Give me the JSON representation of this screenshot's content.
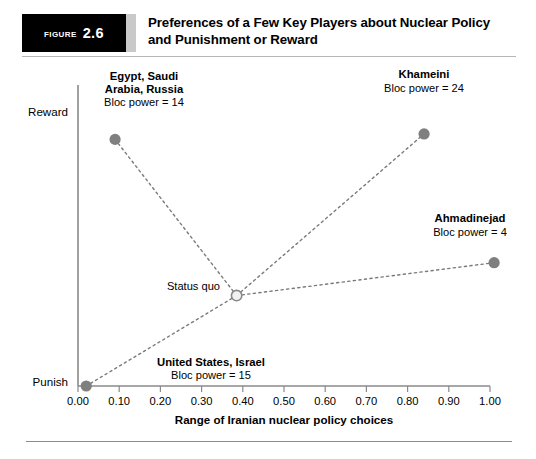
{
  "figure": {
    "tag_word": "Figure",
    "tag_number": "2.6",
    "title_line1": "Preferences of a Few Key Players about Nuclear Policy",
    "title_line2": "and Punishment or Reward"
  },
  "chart_data": {
    "type": "scatter",
    "title": "Preferences of a Few Key Players about Nuclear Policy and Punishment or Reward",
    "xlabel": "Range of Iranian nuclear policy choices",
    "ylabel": "",
    "xlim": [
      0.0,
      1.0
    ],
    "ylim": [
      0,
      100
    ],
    "grid": false,
    "legend": "none",
    "xticks": [
      "0.00",
      "0.10",
      "0.20",
      "0.30",
      "0.40",
      "0.50",
      "0.60",
      "0.70",
      "0.80",
      "0.90",
      "1.00"
    ],
    "xtick_values": [
      0.0,
      0.1,
      0.2,
      0.3,
      0.4,
      0.5,
      0.6,
      0.7,
      0.8,
      0.9,
      1.0
    ],
    "ytick_labels": [
      "Reward",
      "Punish"
    ],
    "ytick_top_label": "Reward",
    "ytick_bottom_label": "Punish",
    "points": [
      {
        "id": "egypt-saudi-russia",
        "label_line1": "Egypt, Saudi",
        "label_line2": "Arabia, Russia",
        "label_line3": "Bloc power = 14",
        "bloc_power": 14,
        "x": 0.09,
        "y": 90
      },
      {
        "id": "khameini",
        "label_line1": "Khameini",
        "label_line2": "Bloc power = 24",
        "bloc_power": 24,
        "x": 0.84,
        "y": 92
      },
      {
        "id": "ahmadinejad",
        "label_line1": "Ahmadinejad",
        "label_line2": "Bloc power = 4",
        "bloc_power": 4,
        "x": 1.01,
        "y": 45
      },
      {
        "id": "united-states-israel",
        "label_line1": "United States, Israel",
        "label_line2": "Bloc power = 15",
        "bloc_power": 15,
        "x": 0.02,
        "y": 0
      },
      {
        "id": "status-quo",
        "label_line1": "Status quo",
        "label_line2": "",
        "bloc_power": null,
        "x": 0.385,
        "y": 33
      }
    ],
    "connections": [
      {
        "from": "status-quo",
        "to": "egypt-saudi-russia"
      },
      {
        "from": "status-quo",
        "to": "khameini"
      },
      {
        "from": "status-quo",
        "to": "ahmadinejad"
      },
      {
        "from": "status-quo",
        "to": "united-states-israel"
      }
    ]
  }
}
